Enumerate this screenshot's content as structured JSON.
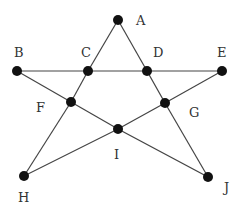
{
  "diagram": {
    "type": "pentagram-graph",
    "points": [
      {
        "id": "A",
        "label": "A",
        "x": 118,
        "y": 20,
        "lx": 136,
        "ly": 14
      },
      {
        "id": "B",
        "label": "B",
        "x": 17,
        "y": 71,
        "lx": 14,
        "ly": 46
      },
      {
        "id": "C",
        "label": "C",
        "x": 88,
        "y": 71,
        "lx": 81,
        "ly": 46
      },
      {
        "id": "D",
        "label": "D",
        "x": 147,
        "y": 71,
        "lx": 153,
        "ly": 46
      },
      {
        "id": "E",
        "label": "E",
        "x": 222,
        "y": 71,
        "lx": 217,
        "ly": 46
      },
      {
        "id": "F",
        "label": "F",
        "x": 71,
        "y": 102,
        "lx": 36,
        "ly": 101
      },
      {
        "id": "G",
        "label": "G",
        "x": 165,
        "y": 103,
        "lx": 189,
        "ly": 106
      },
      {
        "id": "I",
        "label": "I",
        "x": 118,
        "y": 129,
        "lx": 114,
        "ly": 148
      },
      {
        "id": "H",
        "label": "H",
        "x": 24,
        "y": 176,
        "lx": 18,
        "ly": 191
      },
      {
        "id": "J",
        "label": "J",
        "x": 208,
        "y": 177,
        "lx": 224,
        "ly": 181
      }
    ],
    "edges": [
      [
        "A",
        "C"
      ],
      [
        "A",
        "D"
      ],
      [
        "B",
        "C"
      ],
      [
        "C",
        "D"
      ],
      [
        "D",
        "E"
      ],
      [
        "B",
        "F"
      ],
      [
        "F",
        "I"
      ],
      [
        "I",
        "J"
      ],
      [
        "E",
        "G"
      ],
      [
        "G",
        "I"
      ],
      [
        "I",
        "H"
      ],
      [
        "C",
        "F"
      ],
      [
        "F",
        "H"
      ],
      [
        "D",
        "G"
      ],
      [
        "G",
        "J"
      ]
    ],
    "colors": {
      "line": "#444444",
      "node": "#111111",
      "label": "#333333"
    }
  }
}
